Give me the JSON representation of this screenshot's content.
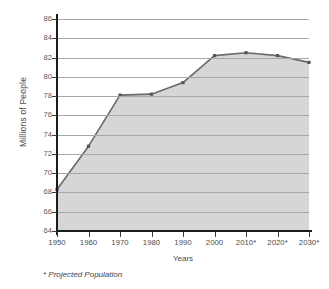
{
  "chart_data": {
    "type": "area",
    "title": "",
    "xlabel": "Years",
    "ylabel": "Millions of People",
    "categories": [
      "1950",
      "1960",
      "1970",
      "1980",
      "1990",
      "2000",
      "2010*",
      "2020*",
      "2030*"
    ],
    "x": [
      1950,
      1960,
      1970,
      1980,
      1990,
      2000,
      2010,
      2020,
      2030
    ],
    "values": [
      68.3,
      72.8,
      78.1,
      78.2,
      79.4,
      82.2,
      82.5,
      82.2,
      81.5
    ],
    "series": [
      {
        "name": "Population",
        "values": [
          68.3,
          72.8,
          78.1,
          78.2,
          79.4,
          82.2,
          82.5,
          82.2,
          81.5
        ]
      }
    ],
    "ylim": [
      64,
      86
    ],
    "yticks": [
      86,
      84,
      82,
      80,
      78,
      76,
      74,
      72,
      70,
      68,
      66,
      64
    ],
    "ytick_labels": [
      "86",
      "84",
      "82",
      "80",
      "78",
      "76",
      "74",
      "72",
      "70",
      "68",
      "66",
      "64"
    ],
    "grid": true,
    "legend": null,
    "legend_position": "none",
    "annotations": [
      "* Projected Population"
    ],
    "line_color": "#6a6a6a",
    "fill_color": "#d6d6d6",
    "grid_color": "#a7a7a7",
    "axis_color": "#1c1c1c",
    "marker_color": "#555555"
  },
  "axes": {
    "y_title": "Millions of People",
    "x_title": "Years"
  },
  "footnote": {
    "text": "* Projected Population"
  }
}
